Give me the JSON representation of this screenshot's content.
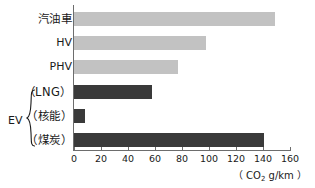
{
  "chart_data": {
    "type": "bar",
    "orientation": "horizontal",
    "title": "",
    "xlabel": "( CO2 g/km )",
    "ylabel": "",
    "xlim": [
      0,
      160
    ],
    "xticks": [
      0,
      20,
      40,
      60,
      80,
      100,
      120,
      140,
      160
    ],
    "grid": false,
    "legend": "none",
    "categories": [
      "汽油車",
      "HV",
      "PHV",
      "（LNG）",
      "（核能）",
      "（煤炭）"
    ],
    "values": [
      149,
      98,
      77,
      58,
      8,
      141
    ],
    "bar_colors": [
      "#c2c2c2",
      "#c2c2c2",
      "#c2c2c2",
      "#3a3a3a",
      "#3a3a3a",
      "#3a3a3a"
    ],
    "group_label": "EV",
    "group_members": [
      "（LNG）",
      "（核能）",
      "（煤炭）"
    ],
    "series": [
      {
        "name": "CO2 emissions",
        "values": [
          149,
          98,
          77,
          58,
          8,
          141
        ]
      }
    ]
  },
  "axis": {
    "unit_prefix": "（ CO",
    "unit_sub": "2",
    "unit_suffix": " g/km ）",
    "ticks": [
      {
        "value": 0,
        "label": "0"
      },
      {
        "value": 20,
        "label": "20"
      },
      {
        "value": 40,
        "label": "40"
      },
      {
        "value": 60,
        "label": "60"
      },
      {
        "value": 80,
        "label": "80"
      },
      {
        "value": 100,
        "label": "100"
      },
      {
        "value": 120,
        "label": "120"
      },
      {
        "value": 140,
        "label": "140"
      },
      {
        "value": 160,
        "label": "160"
      }
    ]
  },
  "bars": [
    {
      "label": "汽油車",
      "value": 149,
      "style": "light",
      "cjk": true
    },
    {
      "label": "HV",
      "value": 98,
      "style": "light",
      "cjk": false
    },
    {
      "label": "PHV",
      "value": 77,
      "style": "light",
      "cjk": false
    },
    {
      "label": "（LNG）",
      "value": 58,
      "style": "dark",
      "cjk": true
    },
    {
      "label": "（核能）",
      "value": 8,
      "style": "dark",
      "cjk": true
    },
    {
      "label": "（煤炭）",
      "value": 141,
      "style": "dark",
      "cjk": true
    }
  ],
  "group": {
    "label": "EV"
  },
  "colors": {
    "light_bar": "#c2c2c2",
    "dark_bar": "#3a3a3a",
    "axis": "#6d6d6d",
    "text": "#1a1a1a",
    "background": "#ffffff"
  }
}
